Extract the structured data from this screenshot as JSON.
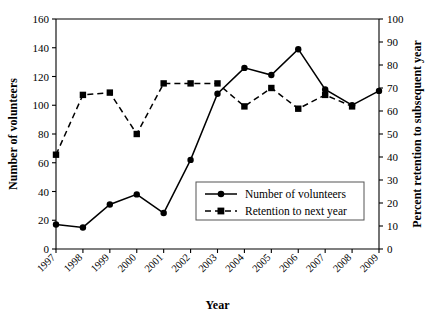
{
  "chart_data": {
    "type": "line",
    "title": "",
    "xlabel": "Year",
    "ylabel": "Number of volunteers",
    "y2label": "Percent retention to subsequent year",
    "categories": [
      "1997",
      "1998",
      "1999",
      "2000",
      "2001",
      "2002",
      "2003",
      "2004",
      "2005",
      "2006",
      "2007",
      "2008",
      "2009"
    ],
    "x": [
      1997,
      1998,
      1999,
      2000,
      2001,
      2002,
      2003,
      2004,
      2005,
      2006,
      2007,
      2008,
      2009
    ],
    "ylim": [
      0,
      160
    ],
    "yticks": [
      0,
      20,
      40,
      60,
      80,
      100,
      120,
      140,
      160
    ],
    "y2lim": [
      0,
      100
    ],
    "y2ticks": [
      0,
      10,
      20,
      30,
      40,
      50,
      60,
      70,
      80,
      90,
      100
    ],
    "grid": false,
    "legend_position": "center-right",
    "series": [
      {
        "name": "Number of volunteers",
        "axis": "left",
        "marker": "circle",
        "linestyle": "solid",
        "values": [
          17,
          15,
          31,
          38,
          25,
          62,
          108,
          126,
          121,
          139,
          111,
          100,
          110
        ]
      },
      {
        "name": "Retention to next year",
        "axis": "right",
        "marker": "square",
        "linestyle": "dashed",
        "values": [
          41,
          67,
          68,
          50,
          72,
          72,
          72,
          62,
          70,
          61,
          67,
          62,
          null
        ]
      }
    ]
  },
  "legend": {
    "entries": [
      {
        "label": "Number of volunteers"
      },
      {
        "label": "Retention to next year"
      }
    ]
  },
  "colors": {
    "ink": "#000000",
    "background": "#ffffff",
    "legend_border": "#555555"
  }
}
